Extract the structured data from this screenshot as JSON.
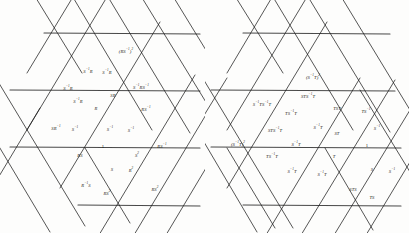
{
  "figure": {
    "kind": "cayley-graph-triangular-lattice",
    "panel_count": 2,
    "background_color": "#fdfdfc",
    "line_color": "#1d1d1d"
  },
  "panels": [
    {
      "id": "left",
      "name": "panel-left",
      "generators": [
        "R",
        "S"
      ],
      "identity_label": "1",
      "labels": [
        {
          "id": "l01",
          "text": "(RS⁻¹)²",
          "html": "(RS<sup>−1</sup>)<sup>2</sup>",
          "x": 126,
          "y": 52
        },
        {
          "id": "l02",
          "text": "S⁻¹R",
          "html": "S<sup>−1</sup>R",
          "x": 88,
          "y": 72
        },
        {
          "id": "l03",
          "text": "S⁻¹R",
          "html": "S<sup>−1</sup>R",
          "x": 107,
          "y": 73
        },
        {
          "id": "l04",
          "text": "S⁻¹R",
          "html": "S<sup>−1</sup>R",
          "x": 68,
          "y": 89
        },
        {
          "id": "l05",
          "text": "S⁻¹RS⁻¹",
          "html": "S<sup>−1</sup>RS<sup>−1</sup>",
          "x": 141,
          "y": 88
        },
        {
          "id": "l06",
          "text": "SR",
          "html": "SR",
          "x": 113,
          "y": 96
        },
        {
          "id": "l07",
          "text": "S⁻¹R",
          "html": "S<sup>−1</sup>R",
          "x": 78,
          "y": 102
        },
        {
          "id": "l08",
          "text": "R",
          "html": "R",
          "x": 96,
          "y": 109
        },
        {
          "id": "l09",
          "text": "RS⁻¹",
          "html": "RS<sup>−1</sup>",
          "x": 146,
          "y": 110
        },
        {
          "id": "l10",
          "text": "SR⁻¹",
          "html": "SR<sup>−1</sup>",
          "x": 56,
          "y": 129
        },
        {
          "id": "l11",
          "text": "S⁻¹",
          "html": "S<sup>−1</sup>",
          "x": 75,
          "y": 130
        },
        {
          "id": "l12",
          "text": "S⁻¹",
          "html": "S<sup>−1</sup>",
          "x": 110,
          "y": 130
        },
        {
          "id": "l13",
          "text": "S⁻¹",
          "html": "S<sup>−1</sup>",
          "x": 131,
          "y": 131
        },
        {
          "id": "l14",
          "text": "1",
          "html": "1",
          "x": 103,
          "y": 147
        },
        {
          "id": "l15",
          "text": "RS",
          "html": "RS",
          "x": 80,
          "y": 156
        },
        {
          "id": "l16",
          "text": "RS⁻¹",
          "html": "RS<sup>−1</sup>",
          "x": 162,
          "y": 147
        },
        {
          "id": "l17",
          "text": "S²",
          "html": "S<sup>2</sup>",
          "x": 137,
          "y": 156
        },
        {
          "id": "l18",
          "text": "S",
          "html": "S",
          "x": 112,
          "y": 170
        },
        {
          "id": "l19",
          "text": "R²",
          "html": "R<sup>2</sup>",
          "x": 131,
          "y": 171
        },
        {
          "id": "l20",
          "text": "R⁻¹S",
          "html": "R<sup>−1</sup>S",
          "x": 86,
          "y": 186
        },
        {
          "id": "l21",
          "text": "RS²",
          "html": "RS<sup>2</sup>",
          "x": 107,
          "y": 194
        },
        {
          "id": "l22",
          "text": "RS²",
          "html": "RS<sup>2</sup>",
          "x": 155,
          "y": 190
        }
      ]
    },
    {
      "id": "right",
      "name": "panel-right",
      "generators": [
        "S",
        "T"
      ],
      "identity_label": "1",
      "labels": [
        {
          "id": "r01",
          "text": "(S⁻¹T)²",
          "html": "(S<sup>−1</sup>T)<sup>2</sup>",
          "x": 313,
          "y": 78
        },
        {
          "id": "r02",
          "text": "STS⁻¹T",
          "html": "STS<sup>−1</sup>T",
          "x": 308,
          "y": 97
        },
        {
          "id": "r03",
          "text": "S⁻¹TS⁻¹T",
          "html": "S<sup>−1</sup>TS<sup>−1</sup>T",
          "x": 262,
          "y": 105
        },
        {
          "id": "r04",
          "text": "TST",
          "html": "TST",
          "x": 337,
          "y": 109
        },
        {
          "id": "r05",
          "text": "TS⁻¹",
          "html": "TS<sup>−1</sup>",
          "x": 366,
          "y": 112
        },
        {
          "id": "r06",
          "text": "TS⁻¹T",
          "html": "TS<sup>−1</sup>T",
          "x": 291,
          "y": 114
        },
        {
          "id": "r07",
          "text": "STS⁻¹T",
          "html": "STS<sup>−1</sup>T",
          "x": 275,
          "y": 131
        },
        {
          "id": "r08",
          "text": "S⁻¹T",
          "html": "S<sup>−1</sup>T",
          "x": 318,
          "y": 128
        },
        {
          "id": "r09",
          "text": "ST",
          "html": "ST",
          "x": 337,
          "y": 134
        },
        {
          "id": "r10",
          "text": "S⁻¹",
          "html": "S<sup>−1</sup>",
          "x": 377,
          "y": 129
        },
        {
          "id": "r11",
          "text": "(S⁻¹T)²",
          "html": "(S<sup>−1</sup>T)<sup>2</sup>",
          "x": 238,
          "y": 145
        },
        {
          "id": "r12",
          "text": "S⁻¹T",
          "html": "S<sup>−1</sup>T",
          "x": 296,
          "y": 145
        },
        {
          "id": "r13",
          "text": "1",
          "html": "1",
          "x": 367,
          "y": 146
        },
        {
          "id": "r14",
          "text": "TS⁻¹T",
          "html": "TS<sup>−1</sup>T",
          "x": 272,
          "y": 157
        },
        {
          "id": "r15",
          "text": "T",
          "html": "T",
          "x": 334,
          "y": 157
        },
        {
          "id": "r16",
          "text": "S⁻¹T",
          "html": "S<sup>−1</sup>T",
          "x": 292,
          "y": 172
        },
        {
          "id": "r17",
          "text": "S⁻¹T",
          "html": "S<sup>−1</sup>T",
          "x": 322,
          "y": 175
        },
        {
          "id": "r18",
          "text": "S",
          "html": "S",
          "x": 372,
          "y": 170
        },
        {
          "id": "r19",
          "text": "S⁻¹",
          "html": "S<sup>−1</sup>",
          "x": 392,
          "y": 172
        },
        {
          "id": "r20",
          "text": "STS",
          "html": "STS",
          "x": 353,
          "y": 190
        },
        {
          "id": "r21",
          "text": "TS",
          "html": "TS",
          "x": 372,
          "y": 198
        }
      ]
    }
  ]
}
